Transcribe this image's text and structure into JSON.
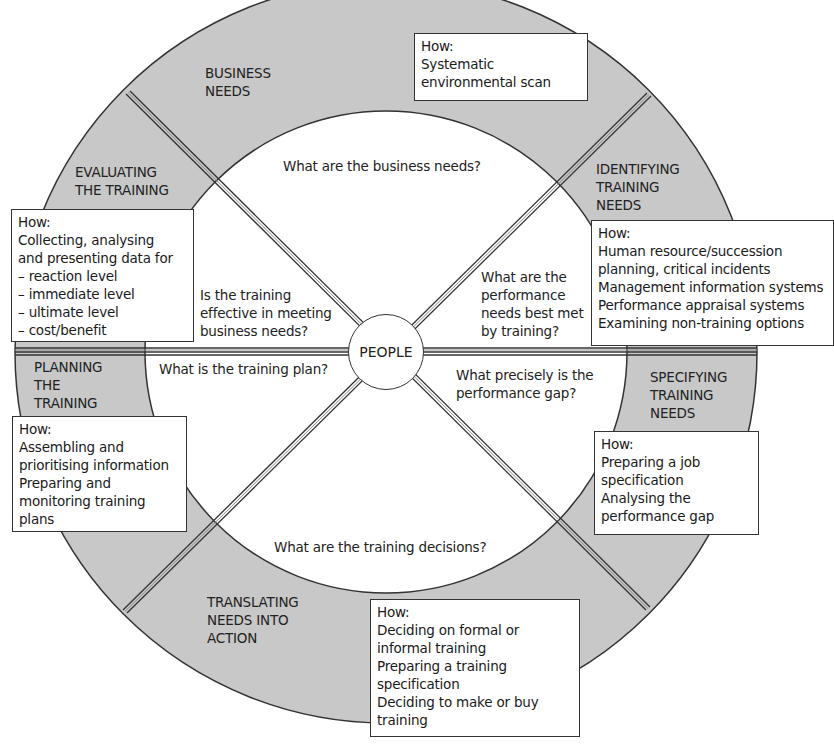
{
  "diagram": {
    "center": {
      "label": "PEOPLE"
    },
    "colors": {
      "ring": "#c8c8c8",
      "line": "#333333",
      "background": "#ffffff"
    },
    "stages": [
      {
        "id": "business-needs",
        "label": "BUSINESS\nNEEDS",
        "question": "What are the business needs?",
        "how": [
          "How:",
          "Systematic",
          "environmental scan"
        ]
      },
      {
        "id": "identifying-training-needs",
        "label": "IDENTIFYING\nTRAINING\nNEEDS",
        "question": "What are the\nperformance\nneeds best met\nby training?",
        "how": [
          "How:",
          "Human resource/succession",
          "planning, critical incidents",
          "Management information systems",
          "Performance appraisal systems",
          "Examining non-training options"
        ]
      },
      {
        "id": "specifying-training-needs",
        "label": "SPECIFYING\nTRAINING\nNEEDS",
        "question": "What precisely is the\nperformance gap?",
        "how": [
          "How:",
          "Preparing a job",
          "specification",
          "Analysing the",
          "performance gap"
        ]
      },
      {
        "id": "translating-needs-into-action",
        "label": "TRANSLATING\nNEEDS INTO\nACTION",
        "question": "What are the training decisions?",
        "how": [
          "How:",
          "Deciding on formal or",
          "informal training",
          "Preparing a training",
          "specification",
          "Deciding to make or buy",
          "training"
        ]
      },
      {
        "id": "planning-the-training",
        "label": "PLANNING\nTHE\nTRAINING",
        "question": "What is the training plan?",
        "how": [
          "How:",
          "Assembling and",
          "prioritising information",
          "Preparing and",
          "monitoring training",
          "plans"
        ]
      },
      {
        "id": "evaluating-the-training",
        "label": "EVALUATING\nTHE TRAINING",
        "question": "Is the training\neffective in meeting\nbusiness needs?",
        "how": [
          "How:",
          "Collecting, analysing",
          "and presenting data for",
          "– reaction level",
          "– immediate level",
          "– ultimate level",
          "– cost/benefit"
        ]
      }
    ]
  }
}
